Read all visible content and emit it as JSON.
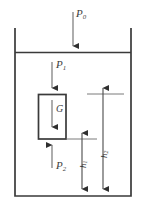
{
  "diagram": {
    "colors": {
      "line": "#3a3a3a",
      "thin_line": "#6b6b6b",
      "background": "#ffffff",
      "text": "#3d3d3d"
    },
    "labels": {
      "p0": {
        "base": "P",
        "sub": "0",
        "name": "ambient-pressure"
      },
      "p1": {
        "base": "P",
        "sub": "1",
        "name": "top-face-pressure"
      },
      "p2": {
        "base": "P",
        "sub": "2",
        "name": "bottom-face-pressure"
      },
      "g": {
        "base": "G",
        "sub": "",
        "name": "weight"
      },
      "h1": {
        "base": "h",
        "sub": "1",
        "name": "depth-to-block-bottom"
      },
      "h2": {
        "base": "h",
        "sub": "2",
        "name": "depth-to-block-top"
      }
    },
    "parts": {
      "container": "container-walls",
      "surface": "liquid-surface-line",
      "block": "submerged-block",
      "arrow_p0": "arrow-p0-down",
      "arrow_p1": "arrow-p1-down",
      "arrow_p2": "arrow-p2-up",
      "arrow_g": "arrow-weight-down",
      "dim_h1": "dimension-line-h1",
      "dim_h2": "dimension-line-h2"
    }
  }
}
